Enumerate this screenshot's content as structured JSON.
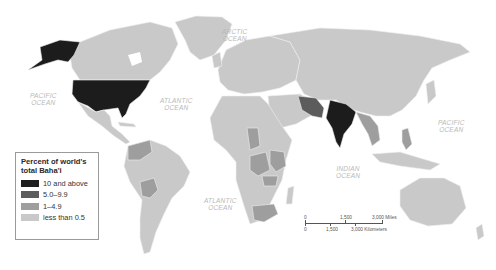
{
  "map": {
    "type": "choropleth",
    "subject": "Percent of world's total Baha'i",
    "oceans": [
      {
        "name": "ARCTIC OCEAN",
        "line1": "ARCTIC",
        "line2": "OCEAN"
      },
      {
        "name": "PACIFIC OCEAN (west)",
        "line1": "PACIFIC",
        "line2": "OCEAN"
      },
      {
        "name": "ATLANTIC OCEAN (north)",
        "line1": "ATLANTIC",
        "line2": "OCEAN"
      },
      {
        "name": "ATLANTIC OCEAN (south)",
        "line1": "ATLANTIC",
        "line2": "OCEAN"
      },
      {
        "name": "INDIAN OCEAN",
        "line1": "INDIAN",
        "line2": "OCEAN"
      },
      {
        "name": "PACIFIC OCEAN (east)",
        "line1": "PACIFIC",
        "line2": "OCEAN"
      }
    ],
    "colors": {
      "ocean": "#ffffff",
      "land_lowest": "#c9c9c9",
      "class_1_4_9": "#9e9e9e",
      "class_5_9_9": "#5c5c5c",
      "class_10_plus": "#1e1e1e",
      "border": "#eeeeee"
    },
    "highlighted_regions": [
      {
        "region": "United States (incl. Alaska)",
        "class": "10 and above"
      },
      {
        "region": "India",
        "class": "10 and above"
      },
      {
        "region": "Iran",
        "class": "5.0–9.9"
      },
      {
        "region": "Venezuela / Colombia",
        "class": "1–4.9"
      },
      {
        "region": "Bolivia",
        "class": "1–4.9"
      },
      {
        "region": "Chad",
        "class": "1–4.9"
      },
      {
        "region": "DR Congo",
        "class": "1–4.9"
      },
      {
        "region": "Kenya / Uganda / Tanzania",
        "class": "1–4.9"
      },
      {
        "region": "Zambia / Malawi",
        "class": "1–4.9"
      },
      {
        "region": "South Africa",
        "class": "1–4.9"
      },
      {
        "region": "Bangladesh / Myanmar / Thailand / Vietnam",
        "class": "1–4.9"
      },
      {
        "region": "Philippines",
        "class": "1–4.9"
      }
    ]
  },
  "legend": {
    "title_line1": "Percent of world's",
    "title_line2": "total Baha'i",
    "items": [
      {
        "label": "10 and above",
        "color": "#1e1e1e"
      },
      {
        "label": "5.0–9.9",
        "color": "#5c5c5c"
      },
      {
        "label": "1–4.9",
        "color": "#9e9e9e"
      },
      {
        "label": "less than 0.5",
        "color": "#c9c9c9"
      }
    ]
  },
  "scale_bar": {
    "miles": [
      "0",
      "1,500",
      "3,000 Miles"
    ],
    "kilometers": [
      "0",
      "1,500",
      "3,000 Kilometers"
    ]
  }
}
